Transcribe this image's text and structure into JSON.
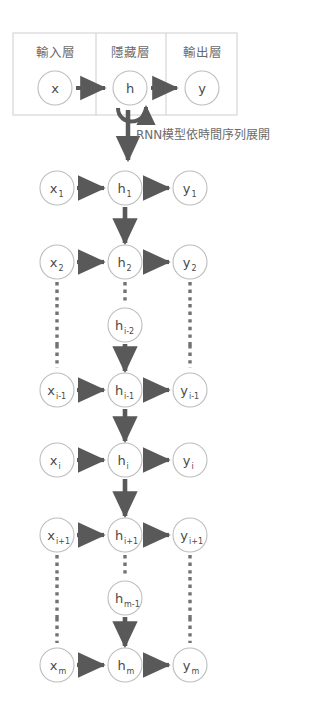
{
  "diagram": {
    "title_caption": "RNN模型依時間序列展開",
    "panel": {
      "columns": [
        {
          "name": "input-layer",
          "label": "輸入層",
          "node": {
            "base": "x",
            "sub": ""
          }
        },
        {
          "name": "hidden-layer",
          "label": "隱藏層",
          "node": {
            "base": "h",
            "sub": ""
          }
        },
        {
          "name": "output-layer",
          "label": "輸出層",
          "node": {
            "base": "y",
            "sub": ""
          }
        }
      ],
      "self_loop": "recurrent-self-loop"
    },
    "columns_x": {
      "input": 57,
      "hidden": 125,
      "output": 190
    },
    "rows": [
      {
        "name": "timestep-1",
        "y": 188,
        "kind": "full",
        "nodes": {
          "x": {
            "base": "x",
            "sub": "1"
          },
          "h": {
            "base": "h",
            "sub": "1"
          },
          "y": {
            "base": "y",
            "sub": "1"
          }
        },
        "below": {
          "input": "none",
          "hidden": "arrow",
          "output": "none"
        }
      },
      {
        "name": "timestep-2",
        "y": 262,
        "kind": "full",
        "nodes": {
          "x": {
            "base": "x",
            "sub": "2"
          },
          "h": {
            "base": "h",
            "sub": "2"
          },
          "y": {
            "base": "y",
            "sub": "2"
          }
        },
        "below": {
          "input": "dotted",
          "hidden": "dotted",
          "output": "dotted"
        }
      },
      {
        "name": "timestep-i-minus-2",
        "y": 325,
        "kind": "hidden-only",
        "nodes": {
          "h": {
            "base": "h",
            "sub": "i-2"
          }
        },
        "below": {
          "input": "dotted",
          "hidden": "arrow",
          "output": "dotted"
        }
      },
      {
        "name": "timestep-i-minus-1",
        "y": 390,
        "kind": "full",
        "nodes": {
          "x": {
            "base": "x",
            "sub": "i-1"
          },
          "h": {
            "base": "h",
            "sub": "i-1"
          },
          "y": {
            "base": "y",
            "sub": "i-1"
          }
        },
        "below": {
          "input": "none",
          "hidden": "arrow",
          "output": "none"
        }
      },
      {
        "name": "timestep-i",
        "y": 460,
        "kind": "full",
        "nodes": {
          "x": {
            "base": "x",
            "sub": "i"
          },
          "h": {
            "base": "h",
            "sub": "i"
          },
          "y": {
            "base": "y",
            "sub": "i"
          }
        },
        "below": {
          "input": "none",
          "hidden": "arrow",
          "output": "none"
        }
      },
      {
        "name": "timestep-i-plus-1",
        "y": 535,
        "kind": "full",
        "nodes": {
          "x": {
            "base": "x",
            "sub": "i+1"
          },
          "h": {
            "base": "h",
            "sub": "i+1"
          },
          "y": {
            "base": "y",
            "sub": "i+1"
          }
        },
        "below": {
          "input": "dotted",
          "hidden": "dotted",
          "output": "dotted"
        }
      },
      {
        "name": "timestep-m-minus-1",
        "y": 598,
        "kind": "hidden-only",
        "nodes": {
          "h": {
            "base": "h",
            "sub": "m-1"
          }
        },
        "below": {
          "input": "dotted",
          "hidden": "arrow",
          "output": "dotted"
        }
      },
      {
        "name": "timestep-m",
        "y": 665,
        "kind": "full",
        "nodes": {
          "x": {
            "base": "x",
            "sub": "m"
          },
          "h": {
            "base": "h",
            "sub": "m"
          },
          "y": {
            "base": "y",
            "sub": "m"
          }
        },
        "below": {
          "input": "none",
          "hidden": "none",
          "output": "none"
        }
      }
    ],
    "colors": {
      "arrow": "#595959",
      "circle_stroke": "#bdbdbd",
      "panel_stroke": "#d2d2d2",
      "text": "#6b6b6b",
      "node_text": "#4a4a4a",
      "background": "#ffffff"
    },
    "geometry": {
      "panel": {
        "x": 13,
        "y": 33,
        "w": 224,
        "h": 82
      },
      "panel_dividers": [
        83,
        166
      ],
      "node_radius": 17,
      "panel_node_radius": 17,
      "panel_row_y": 88,
      "panel_label_y": 53,
      "caption_x": 128,
      "caption_y": 144
    }
  }
}
